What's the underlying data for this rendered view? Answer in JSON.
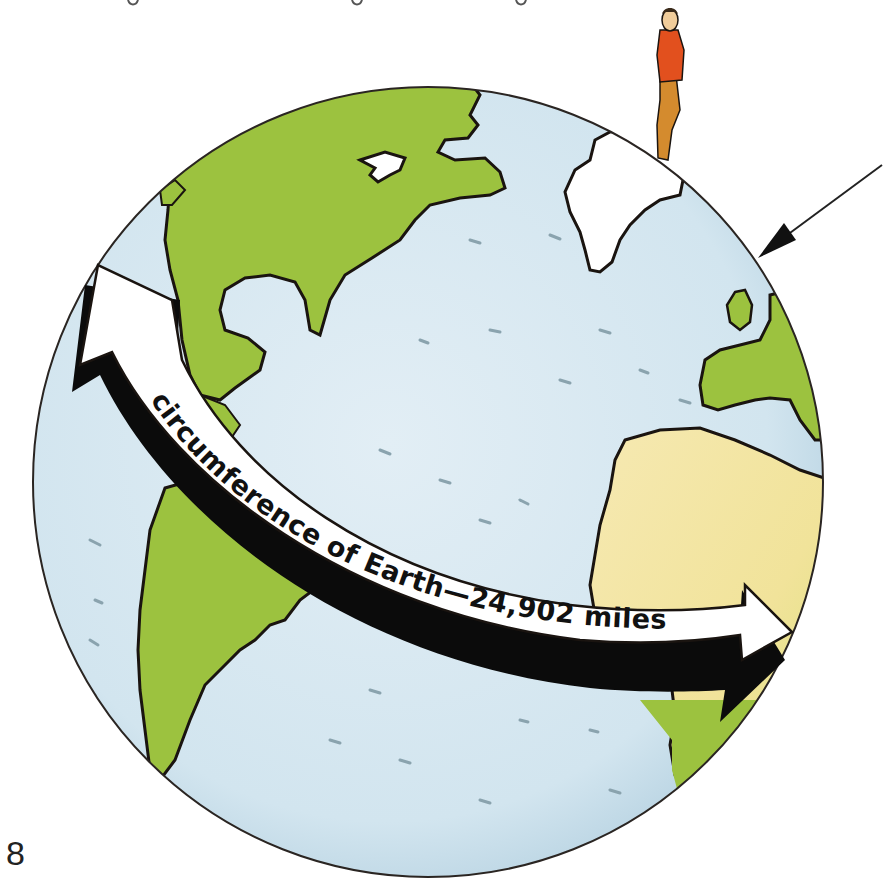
{
  "illustration": {
    "subject": "Earth globe with circumference arrow",
    "label": {
      "prefix": "circumference of Earth",
      "dash": "—",
      "value": "24,902",
      "unit": "miles",
      "full_text": "circumference of Earth—24,902 miles"
    },
    "elements": {
      "globe": "globe-icon",
      "person": "person-figure",
      "pointer_arrow": "arrow-pointer-icon",
      "circumference_arrow": "double-arrow-icon"
    },
    "colors": {
      "ocean": "#d6e8f1",
      "ocean_shadow": "#bcd6e4",
      "land_green": "#9cc23f",
      "land_dark_green": "#7fa82a",
      "desert": "#f4e6a8",
      "ice": "#ffffff",
      "outline": "#1a1410",
      "arrow_fill": "#ffffff",
      "arrow_shadow": "#0b0b0b",
      "person_shirt": "#e2501e",
      "person_pants": "#d48b2e",
      "person_skin": "#f0cc9a"
    }
  },
  "page": {
    "number": "8",
    "top_text_fragment": "g       g       y"
  }
}
